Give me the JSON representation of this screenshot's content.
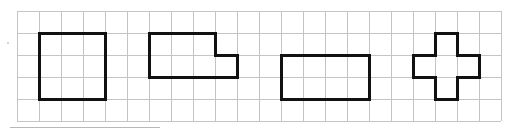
{
  "grid": {
    "origin_x": 17,
    "origin_y": 11,
    "cell": 22,
    "cols": 22,
    "rows": 5,
    "line_color": "#c4c4c4"
  },
  "shapes": [
    {
      "name": "square",
      "points": [
        [
          1,
          1
        ],
        [
          4,
          1
        ],
        [
          4,
          4
        ],
        [
          1,
          4
        ]
      ]
    },
    {
      "name": "l-shape",
      "points": [
        [
          6,
          1
        ],
        [
          9,
          1
        ],
        [
          9,
          2
        ],
        [
          10,
          2
        ],
        [
          10,
          3
        ],
        [
          6,
          3
        ]
      ]
    },
    {
      "name": "rectangle",
      "points": [
        [
          12,
          2
        ],
        [
          16,
          2
        ],
        [
          16,
          4
        ],
        [
          12,
          4
        ]
      ]
    },
    {
      "name": "cross",
      "points": [
        [
          19,
          1
        ],
        [
          20,
          1
        ],
        [
          20,
          2
        ],
        [
          21,
          2
        ],
        [
          21,
          3
        ],
        [
          20,
          3
        ],
        [
          20,
          4
        ],
        [
          19,
          4
        ],
        [
          19,
          3
        ],
        [
          18,
          3
        ],
        [
          18,
          2
        ],
        [
          19,
          2
        ]
      ]
    }
  ],
  "shape_color": "#111111",
  "underline": {
    "x1": 10,
    "x2": 160,
    "y": 127
  },
  "stray_dot": {
    "x": 8,
    "y": 43
  }
}
